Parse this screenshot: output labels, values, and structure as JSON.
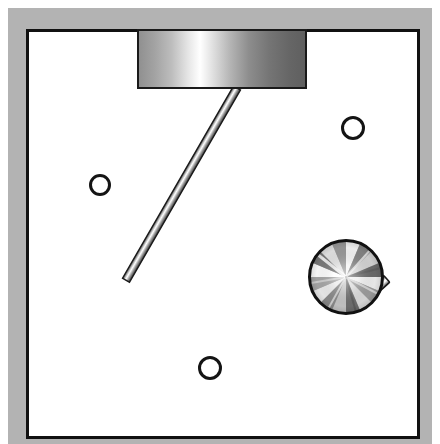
{
  "figure": {
    "title": "Planar mechanical linkage diagram",
    "width": 440,
    "height": 444
  },
  "canvas": {
    "background_color": "#ffffff",
    "outer_frame_color": "#b3b3b3",
    "outer_frame_label": "outer mat border",
    "outer_frame": {
      "x": 8,
      "y": 8,
      "width": 424,
      "height": 436,
      "thickness": 18
    },
    "inner_border_color": "#111111",
    "inner_border_width": 3,
    "inner_border": {
      "x": 26,
      "y": 29,
      "width": 394,
      "height": 410
    },
    "workspace_color": "#ffffff"
  },
  "parts": {
    "slider_block": {
      "label": "Slider block",
      "shape": "rectangle",
      "x": 138,
      "y": 29,
      "width": 168,
      "height": 59,
      "outline_color": "#1a1a1a",
      "outline_width": 2,
      "fill_style": "horizontal metallic gradient",
      "gradient_stops": [
        "#8f8f8f",
        "#b9b9b9",
        "#ffffff",
        "#d2d2d2",
        "#8a8a8a",
        "#6e6e6e",
        "#5f5f5f"
      ]
    },
    "connecting_rod": {
      "label": "Connecting rod",
      "shape": "slender cylinder",
      "from_x": 237,
      "from_y": 88,
      "to_x": 346,
      "to_y": 277,
      "thickness": 7,
      "length": 218,
      "angle_deg": 60,
      "outline_color": "#1a1a1a",
      "fill_style": "cylindrical metallic gradient",
      "gradient_stops": [
        "#4a4a4a",
        "#b6b6b6",
        "#ffffff",
        "#cfcfcf",
        "#6d6d6d",
        "#3f3f3f"
      ]
    },
    "crank_disk": {
      "label": "Crank disk",
      "shape": "circle",
      "center_x": 346,
      "center_y": 277,
      "radius": 37,
      "outline_color": "#111111",
      "outline_width": 3,
      "fill_style": "conic brushed metal",
      "ray_count": 16,
      "gradient_stops": [
        "#9a9a9a",
        "#ffffff",
        "#707070",
        "#e8e8e8",
        "#595959",
        "#f4f4f4",
        "#808080"
      ]
    },
    "crank_pin": {
      "label": "Crank pin stub",
      "shape": "slender cylinder",
      "from_x": 361,
      "from_y": 307,
      "to_x": 384,
      "to_y": 333,
      "thickness": 8,
      "outline_color": "#1a1a1a",
      "fill_style": "cylindrical metallic gradient",
      "gradient_stops": [
        "#4f4f4f",
        "#cccccc",
        "#ffffff",
        "#a8a8a8",
        "#4a4a4a"
      ]
    }
  },
  "holes": {
    "label": "Mounting holes",
    "outline_color": "#111111",
    "outline_width": 3,
    "fill_color": "#ffffff",
    "items": [
      {
        "name": "hole-upper-right",
        "center_x": 353,
        "center_y": 128,
        "radius": 11
      },
      {
        "name": "hole-left",
        "center_x": 100,
        "center_y": 185,
        "radius": 10
      },
      {
        "name": "hole-bottom",
        "center_x": 210,
        "center_y": 368,
        "radius": 11
      }
    ]
  }
}
